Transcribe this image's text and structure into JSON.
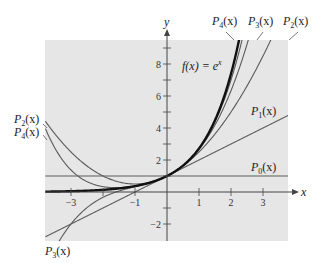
{
  "chart_data": {
    "type": "line",
    "title": "",
    "xlabel": "x",
    "ylabel": "y",
    "xlim": [
      -3.8,
      3.78
    ],
    "ylim": [
      -3.06,
      9.5
    ],
    "x_ticks": [
      -3,
      -2,
      -1,
      1,
      2,
      3
    ],
    "x_tick_labels": [
      "−3",
      "",
      "−1",
      "1",
      "2",
      "3"
    ],
    "y_ticks": [
      -2,
      -1,
      1,
      2,
      3,
      4,
      5,
      6,
      7,
      8,
      9
    ],
    "y_tick_labels": [
      "−2",
      "",
      "",
      "2",
      "",
      "4",
      "",
      "6",
      "",
      "8",
      ""
    ],
    "grid": false,
    "series": [
      {
        "name": "f(x) = e^x",
        "label": "f(x) = e",
        "sup": "x",
        "expr": "exp",
        "coeffs": null,
        "color": "#111111",
        "width": 2.4
      },
      {
        "name": "P0(x)",
        "label": "P",
        "sub": "0",
        "expr": "poly",
        "coeffs": [
          1
        ],
        "color": "#5a5a5a",
        "width": 1.1
      },
      {
        "name": "P1(x)",
        "label": "P",
        "sub": "1",
        "expr": "poly",
        "coeffs": [
          1,
          1
        ],
        "color": "#5a5a5a",
        "width": 1.1
      },
      {
        "name": "P2(x)",
        "label": "P",
        "sub": "2",
        "expr": "poly",
        "coeffs": [
          1,
          1,
          0.5
        ],
        "color": "#5a5a5a",
        "width": 1.1
      },
      {
        "name": "P3(x)",
        "label": "P",
        "sub": "3",
        "expr": "poly",
        "coeffs": [
          1,
          1,
          0.5,
          0.1666667
        ],
        "color": "#5a5a5a",
        "width": 1.1
      },
      {
        "name": "P4(x)",
        "label": "P",
        "sub": "4",
        "expr": "poly",
        "coeffs": [
          1,
          1,
          0.5,
          0.1666667,
          0.0416667
        ],
        "color": "#5a5a5a",
        "width": 1.1
      }
    ],
    "annotations": [
      {
        "text": "f(x) = e^x",
        "x": 1.1,
        "y": 8.3
      },
      {
        "text": "P4(x)",
        "anchor": "top",
        "x": 2.2
      },
      {
        "text": "P3(x)",
        "anchor": "top",
        "x": 2.4
      },
      {
        "text": "P2(x)",
        "anchor": "top",
        "x": 3.1
      },
      {
        "text": "P1(x)",
        "x": 2.6,
        "y": 5.0
      },
      {
        "text": "P0(x)",
        "x": 2.6,
        "y": 1.35
      },
      {
        "text": "P2(x)",
        "anchor": "left",
        "y": 4.4
      },
      {
        "text": "P4(x)",
        "anchor": "left",
        "y": 3.9
      },
      {
        "text": "P3(x)",
        "anchor": "bottom-left",
        "x": -3.3
      }
    ]
  },
  "labels": {
    "f": "f(x) = e",
    "f_sup": "x",
    "x_axis": "x",
    "y_axis": "y",
    "P": "P",
    "arg": "(x)",
    "sub0": "0",
    "sub1": "1",
    "sub2": "2",
    "sub3": "3",
    "sub4": "4"
  },
  "colors": {
    "plot_background": "#e6e6e6",
    "axis": "#444444",
    "curve": "#5a5a5a",
    "exp_curve": "#111111"
  }
}
